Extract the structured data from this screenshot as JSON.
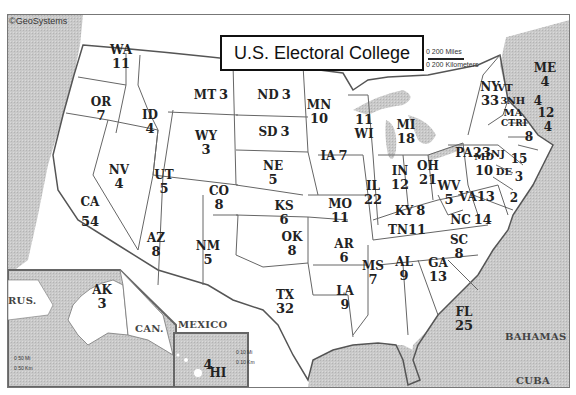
{
  "title": "U.S. Electoral College",
  "copyright": "©GeoSystems",
  "scale": {
    "miles": "0     200 Miles",
    "km": "0   200 Kilometers"
  },
  "inset_scale": {
    "miles": "0  50 Mi",
    "km": "0 50 Km"
  },
  "hi_scale": {
    "miles": "0  10 Mi",
    "km": "0  10 Km"
  },
  "regions": {
    "rus": "RUS.",
    "can": "CAN.",
    "mexico": "MEXICO",
    "bahamas": "BAHAMAS",
    "cuba": "CUBA"
  },
  "states": [
    {
      "abbr": "WA",
      "votes": "11"
    },
    {
      "abbr": "OR",
      "votes": "7"
    },
    {
      "abbr": "CA",
      "votes": "54"
    },
    {
      "abbr": "ID",
      "votes": "4"
    },
    {
      "abbr": "NV",
      "votes": "4"
    },
    {
      "abbr": "MT",
      "votes": "3"
    },
    {
      "abbr": "WY",
      "votes": "3"
    },
    {
      "abbr": "UT",
      "votes": "5"
    },
    {
      "abbr": "AZ",
      "votes": "8"
    },
    {
      "abbr": "CO",
      "votes": "8"
    },
    {
      "abbr": "NM",
      "votes": "5"
    },
    {
      "abbr": "ND",
      "votes": "3"
    },
    {
      "abbr": "SD",
      "votes": "3"
    },
    {
      "abbr": "NE",
      "votes": "5"
    },
    {
      "abbr": "KS",
      "votes": "6"
    },
    {
      "abbr": "OK",
      "votes": "8"
    },
    {
      "abbr": "TX",
      "votes": "32"
    },
    {
      "abbr": "MN",
      "votes": "10"
    },
    {
      "abbr": "IA",
      "votes": "7"
    },
    {
      "abbr": "MO",
      "votes": "11"
    },
    {
      "abbr": "AR",
      "votes": "6"
    },
    {
      "abbr": "LA",
      "votes": "9"
    },
    {
      "abbr": "WI",
      "votes": "11"
    },
    {
      "abbr": "IL",
      "votes": "22"
    },
    {
      "abbr": "MI",
      "votes": "18"
    },
    {
      "abbr": "IN",
      "votes": "12"
    },
    {
      "abbr": "OH",
      "votes": "21"
    },
    {
      "abbr": "KY",
      "votes": "8"
    },
    {
      "abbr": "TN",
      "votes": "11"
    },
    {
      "abbr": "MS",
      "votes": "7"
    },
    {
      "abbr": "AL",
      "votes": "9"
    },
    {
      "abbr": "GA",
      "votes": "13"
    },
    {
      "abbr": "FL",
      "votes": "25"
    },
    {
      "abbr": "SC",
      "votes": "8"
    },
    {
      "abbr": "NC",
      "votes": "14"
    },
    {
      "abbr": "VA",
      "votes": "13"
    },
    {
      "abbr": "WV",
      "votes": "5"
    },
    {
      "abbr": "PA",
      "votes": "23"
    },
    {
      "abbr": "NY",
      "votes": "33"
    },
    {
      "abbr": "VT",
      "votes": "3"
    },
    {
      "abbr": "NH",
      "votes": "4"
    },
    {
      "abbr": "ME",
      "votes": "4"
    },
    {
      "abbr": "MA",
      "votes": "12"
    },
    {
      "abbr": "RI",
      "votes": "4"
    },
    {
      "abbr": "CT",
      "votes": "8"
    },
    {
      "abbr": "NJ",
      "votes": "15"
    },
    {
      "abbr": "DE",
      "votes": "3"
    },
    {
      "abbr": "MD",
      "votes": "10"
    },
    {
      "abbr": "DC",
      "votes": "3"
    },
    {
      "abbr": "AK",
      "votes": "3"
    },
    {
      "abbr": "HI",
      "votes": "4"
    }
  ],
  "callouts": {
    "md_dc": "2"
  }
}
